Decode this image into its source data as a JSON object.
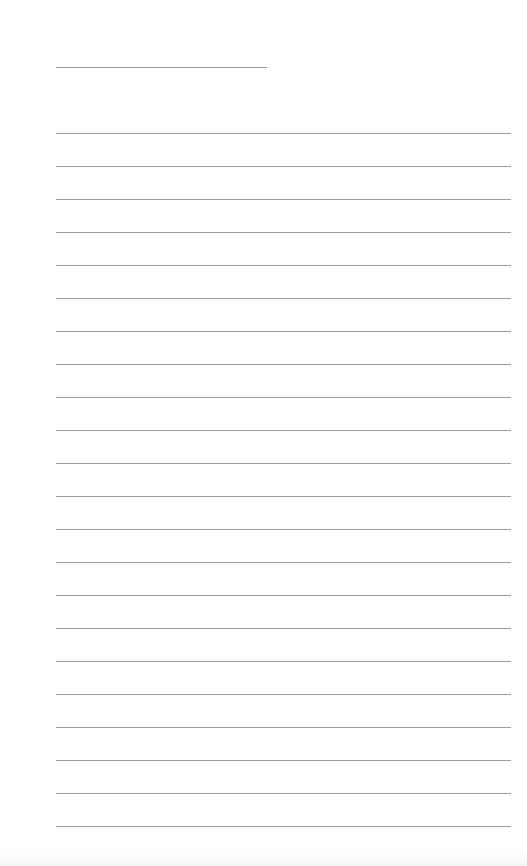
{
  "page": {
    "type": "lined-paper",
    "background_color": "#ffffff",
    "line_color": "#9c9c9c",
    "title_line": {
      "x": 56,
      "y": 67,
      "width": 211
    },
    "rules": {
      "count": 22,
      "start_y": 133,
      "spacing": 33,
      "x": 56,
      "width": 455
    }
  }
}
